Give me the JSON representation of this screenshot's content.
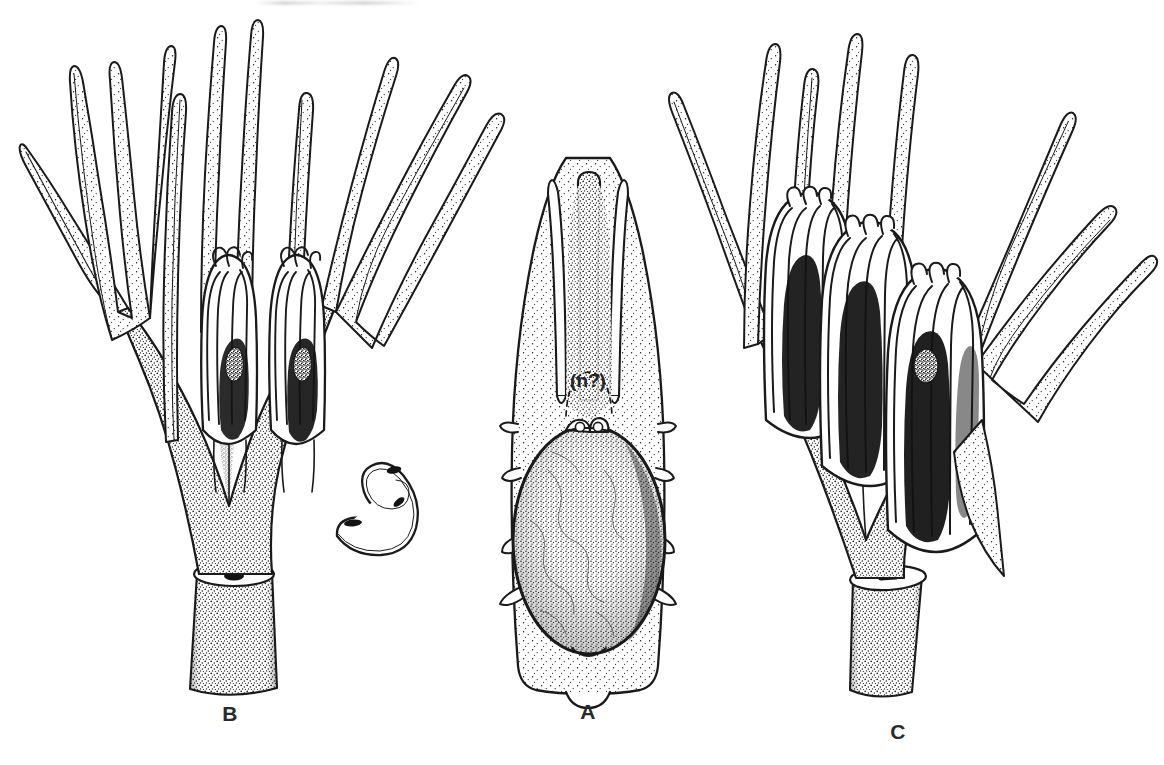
{
  "plate": {
    "kind": "botanical-line-illustration",
    "technique": "pen-and-ink stipple",
    "background_color": "#ffffff",
    "ink_color": "#1a1a1a",
    "width": 1164,
    "height": 765,
    "panel_count": 3
  },
  "panels": [
    {
      "id": "B",
      "label": "B",
      "position": "left",
      "label_x": 230,
      "label_y": 714,
      "description": "Dissected reproductive shoot with spreading acuminate bracts and two immature synangia enclosed at the centre; cut stem base with circular vascular scar and a severed lateral branch with three elliptic vascular traces."
    },
    {
      "id": "A",
      "label": "A",
      "position": "center",
      "label_x": 588,
      "label_y": 712,
      "description": "Flattened sporophyll / bract in face view, apex divided into three acuminate lobes, bearing a large stippled ovoid ovule with a small paired micropylar knob at its apex."
    },
    {
      "id": "C",
      "label": "C",
      "position": "right",
      "label_x": 898,
      "label_y": 732,
      "description": "Mature reproductive shoot with spreading bracts and clustered elongate ribbed synangia whose lobes are dark-shaded; cut stem base with elliptic face and dark vascular slit."
    }
  ],
  "annotations": [
    {
      "id": "ovule-query",
      "text": "(n?)",
      "panel": "A",
      "x": 588,
      "y": 381,
      "note": "pencilled query marking an obscure structure above the ovule"
    }
  ]
}
